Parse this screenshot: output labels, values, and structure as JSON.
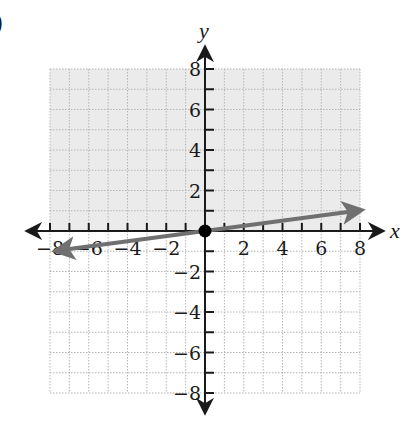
{
  "figure": {
    "part_marker": ")",
    "x_axis_label": "x",
    "y_axis_label": "y"
  },
  "colors": {
    "shaded_region": "#ebebeb",
    "grid": "#b5b5b5",
    "axis": "#1a1a1a",
    "line": "#707070",
    "point": "#000000"
  },
  "chart_data": {
    "type": "line",
    "title": "",
    "xlabel": "x",
    "ylabel": "y",
    "xlim": [
      -8,
      8
    ],
    "ylim": [
      -8,
      8
    ],
    "grid": true,
    "x_ticks": [
      -8,
      -6,
      -4,
      -2,
      2,
      4,
      6,
      8
    ],
    "y_ticks": [
      8,
      6,
      4,
      2,
      -2,
      -4,
      -6,
      -8
    ],
    "x_tick_labels": [
      "−8",
      "−6",
      "−4",
      "−2",
      "2",
      "4",
      "6",
      "8"
    ],
    "y_tick_labels": [
      "8",
      "6",
      "4",
      "2",
      "−2",
      "−4",
      "−6",
      "−8"
    ],
    "series": [
      {
        "name": "line y = x/8",
        "equation": "y = x/8",
        "x": [
          -8,
          0,
          8
        ],
        "y": [
          -1,
          0,
          1
        ],
        "style": "solid line with arrows at both ends"
      }
    ],
    "points": [
      {
        "x": 0,
        "y": 0,
        "label": "origin (solid dot)"
      }
    ],
    "shaded_region": "upper half-plane above the x-axis (y > 0), from x=-8 to 8, y=0 to 8"
  }
}
